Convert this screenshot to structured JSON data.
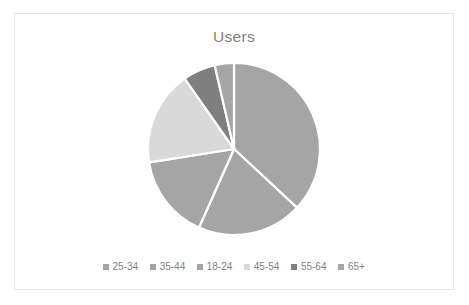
{
  "chart": {
    "title": "Users",
    "title_color": "#7f7f7f",
    "background_color": "#ffffff",
    "border_color": "#e6e6e6",
    "legend_text_color": "#7f7f7f",
    "slice_separator_color": "#ffffff"
  },
  "chart_data": {
    "type": "pie",
    "title": "Users",
    "xlabel": "",
    "ylabel": "",
    "grid": false,
    "legend_position": "bottom",
    "legend_orientation": "horizontal",
    "start_angle_deg": 0,
    "direction": "clockwise",
    "center": {
      "x": 233,
      "y": 148
    },
    "radius": 86,
    "categories": [
      "25-34",
      "35-44",
      "18-24",
      "45-54",
      "55-64",
      "65+"
    ],
    "values": [
      37.0,
      19.7,
      15.8,
      17.8,
      6.1,
      3.6
    ],
    "units": "percent",
    "colors": [
      "#a5a5a5",
      "#a5a5a5",
      "#a5a5a5",
      "#d9d9d9",
      "#7f7f7f",
      "#a5a5a5"
    ],
    "slices": [
      {
        "label": "25-34",
        "value": 37.0,
        "start_deg": 0,
        "end_deg": 133,
        "color": "#a5a5a5"
      },
      {
        "label": "35-44",
        "value": 19.7,
        "start_deg": 133,
        "end_deg": 204,
        "color": "#a5a5a5"
      },
      {
        "label": "18-24",
        "value": 15.8,
        "start_deg": 204,
        "end_deg": 261,
        "color": "#a5a5a5"
      },
      {
        "label": "45-54",
        "value": 17.8,
        "start_deg": 261,
        "end_deg": 325,
        "color": "#d9d9d9"
      },
      {
        "label": "55-64",
        "value": 6.1,
        "start_deg": 325,
        "end_deg": 347,
        "color": "#7f7f7f"
      },
      {
        "label": "65+",
        "value": 3.6,
        "start_deg": 347,
        "end_deg": 360,
        "color": "#a5a5a5"
      }
    ]
  },
  "legend": {
    "items": [
      {
        "label": "25-34",
        "color": "#a5a5a5"
      },
      {
        "label": "35-44",
        "color": "#a5a5a5"
      },
      {
        "label": "18-24",
        "color": "#a5a5a5"
      },
      {
        "label": "45-54",
        "color": "#d9d9d9"
      },
      {
        "label": "55-64",
        "color": "#7f7f7f"
      },
      {
        "label": "65+",
        "color": "#a5a5a5"
      }
    ]
  }
}
